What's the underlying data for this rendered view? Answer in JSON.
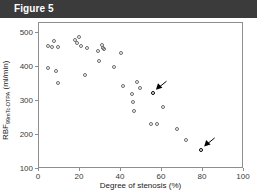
{
  "figure": {
    "banner_label": "Figure 5",
    "banner_color": "#3b3b3b"
  },
  "chart_data": {
    "type": "scatter",
    "title": "",
    "xlabel": "Degree of stenosis (%)",
    "ylabel": "RBF 99mTc-DTPA (ml/min)",
    "ylabel_main": "RBF",
    "ylabel_sub": "99mTc-DTPA",
    "ylabel_unit": "(ml/min)",
    "xlim": [
      0,
      100
    ],
    "ylim": [
      100,
      530
    ],
    "xticks": [
      0,
      20,
      40,
      60,
      80,
      100
    ],
    "yticks": [
      100,
      200,
      300,
      400,
      500
    ],
    "grid": false,
    "legend": null,
    "marker": "open-circle",
    "points": [
      {
        "x": 4.5,
        "y": 462
      },
      {
        "x": 4.5,
        "y": 398
      },
      {
        "x": 6.5,
        "y": 460
      },
      {
        "x": 7.5,
        "y": 478
      },
      {
        "x": 8.5,
        "y": 388
      },
      {
        "x": 9.5,
        "y": 460
      },
      {
        "x": 9.5,
        "y": 352
      },
      {
        "x": 17.5,
        "y": 481
      },
      {
        "x": 18.5,
        "y": 470
      },
      {
        "x": 19.5,
        "y": 490
      },
      {
        "x": 20.5,
        "y": 462
      },
      {
        "x": 22.5,
        "y": 378
      },
      {
        "x": 23.5,
        "y": 457
      },
      {
        "x": 29.0,
        "y": 448
      },
      {
        "x": 29.5,
        "y": 418
      },
      {
        "x": 30.5,
        "y": 466
      },
      {
        "x": 31.0,
        "y": 455
      },
      {
        "x": 31.5,
        "y": 452
      },
      {
        "x": 36.5,
        "y": 400
      },
      {
        "x": 40.0,
        "y": 441
      },
      {
        "x": 41.0,
        "y": 344
      },
      {
        "x": 45.5,
        "y": 322
      },
      {
        "x": 46.0,
        "y": 298
      },
      {
        "x": 46.5,
        "y": 271
      },
      {
        "x": 48.0,
        "y": 355
      },
      {
        "x": 49.5,
        "y": 340
      },
      {
        "x": 54.5,
        "y": 232
      },
      {
        "x": 55.5,
        "y": 324,
        "highlighted": true
      },
      {
        "x": 57.5,
        "y": 234
      },
      {
        "x": 60.5,
        "y": 284
      },
      {
        "x": 67.5,
        "y": 218
      },
      {
        "x": 71.5,
        "y": 185
      },
      {
        "x": 79.0,
        "y": 157,
        "highlighted": true
      }
    ],
    "annotations": [
      {
        "name": "arrow-to-point-55-324",
        "target_x": 55.5,
        "target_y": 324,
        "direction": "down-left"
      },
      {
        "name": "arrow-to-point-79-157",
        "target_x": 79.0,
        "target_y": 157,
        "direction": "down-left"
      }
    ]
  }
}
